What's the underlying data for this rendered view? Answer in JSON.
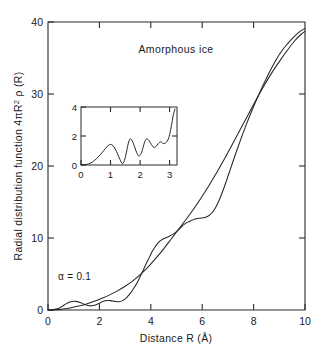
{
  "figure": {
    "title": "Amorphous ice",
    "annotation": "α = 0.1",
    "xlabel": "Distance  R (Å)",
    "ylabel_prefix": "Radial  distribution  function  4πR",
    "ylabel_exp": "2",
    "ylabel_suffix": " ρ (R)",
    "xticks": [
      "0",
      "2",
      "4",
      "6",
      "8",
      "10"
    ],
    "yticks": [
      "0",
      "10",
      "20",
      "30",
      "40"
    ],
    "inset_xticks": [
      "0",
      "1",
      "2",
      "3"
    ],
    "inset_yticks": [
      "0",
      "2",
      "4"
    ]
  },
  "chart_data": {
    "type": "line",
    "title": "Amorphous ice",
    "xlabel": "Distance  R (Å)",
    "ylabel": "Radial distribution function 4πR² ρ(R)",
    "xlim": [
      0,
      10
    ],
    "ylim": [
      0,
      40
    ],
    "xticks": [
      0,
      2,
      4,
      6,
      8,
      10
    ],
    "yticks": [
      0,
      10,
      20,
      30,
      40
    ],
    "grid": false,
    "legend": "none",
    "annotations": [
      {
        "text": "α = 0.1",
        "x": 0.55,
        "y": 4.6
      },
      {
        "text": "Amorphous ice",
        "x": 5.0,
        "y": 37.0
      }
    ],
    "series": [
      {
        "name": "experimental RDF (oscillatory)",
        "x": [
          0.0,
          0.2,
          0.4,
          0.55,
          0.7,
          0.85,
          1.0,
          1.1,
          1.25,
          1.4,
          1.55,
          1.7,
          1.85,
          2.0,
          2.15,
          2.3,
          2.45,
          2.6,
          2.75,
          2.9,
          3.05,
          3.2,
          3.35,
          3.5,
          3.7,
          3.9,
          4.1,
          4.3,
          4.5,
          4.7,
          4.9,
          5.1,
          5.3,
          5.5,
          5.7,
          5.9,
          6.1,
          6.3,
          6.5,
          6.7,
          6.9,
          7.1,
          7.3,
          7.5,
          7.7,
          7.9,
          8.1,
          8.3,
          8.5,
          8.7,
          8.9,
          9.1,
          9.3,
          9.5,
          9.7,
          9.85,
          10.0
        ],
        "y": [
          0.0,
          0.05,
          0.2,
          0.5,
          0.85,
          1.1,
          1.22,
          1.2,
          1.05,
          0.8,
          0.62,
          0.58,
          0.7,
          0.95,
          1.2,
          1.32,
          1.3,
          1.2,
          1.15,
          1.3,
          1.7,
          2.3,
          3.1,
          4.0,
          5.5,
          7.0,
          8.4,
          9.4,
          9.9,
          10.2,
          10.6,
          11.2,
          11.9,
          12.3,
          12.6,
          12.75,
          12.85,
          13.2,
          14.1,
          15.6,
          17.5,
          19.6,
          21.7,
          23.7,
          25.6,
          27.4,
          29.1,
          30.7,
          32.2,
          33.6,
          34.9,
          36.0,
          36.9,
          37.7,
          38.4,
          38.8,
          39.1
        ]
      },
      {
        "name": "smooth 4πR²ρ₀ reference",
        "x": [
          0.0,
          0.3,
          0.6,
          0.9,
          1.2,
          1.5,
          1.8,
          2.1,
          2.4,
          2.7,
          3.0,
          3.3,
          3.6,
          3.9,
          4.2,
          4.5,
          4.8,
          5.1,
          5.4,
          5.7,
          6.0,
          6.3,
          6.6,
          6.9,
          7.2,
          7.5,
          7.8,
          8.1,
          8.4,
          8.7,
          9.0,
          9.3,
          9.6,
          9.85,
          10.0
        ],
        "y": [
          0.0,
          0.05,
          0.15,
          0.32,
          0.55,
          0.85,
          1.2,
          1.62,
          2.1,
          2.66,
          3.3,
          4.05,
          4.95,
          6.0,
          7.2,
          8.5,
          9.9,
          11.3,
          12.7,
          14.2,
          15.8,
          17.5,
          19.3,
          21.2,
          23.2,
          25.2,
          27.2,
          29.2,
          31.1,
          32.9,
          34.5,
          36.0,
          37.4,
          38.3,
          38.7
        ]
      }
    ],
    "inset": {
      "type": "line",
      "xlim": [
        0,
        3.25
      ],
      "ylim": [
        0,
        4
      ],
      "xticks": [
        0,
        1,
        2,
        3
      ],
      "yticks": [
        0,
        2,
        4
      ],
      "grid": false,
      "series": [
        {
          "name": "short-range RDF detail",
          "x": [
            0.0,
            0.18,
            0.32,
            0.45,
            0.58,
            0.7,
            0.82,
            0.92,
            1.0,
            1.08,
            1.16,
            1.24,
            1.32,
            1.4,
            1.47,
            1.54,
            1.6,
            1.66,
            1.72,
            1.8,
            1.88,
            1.96,
            2.04,
            2.1,
            2.16,
            2.22,
            2.3,
            2.38,
            2.46,
            2.54,
            2.62,
            2.7,
            2.78,
            2.86,
            2.94,
            3.0,
            3.06,
            3.12,
            3.18
          ],
          "y": [
            0.02,
            0.04,
            0.12,
            0.3,
            0.55,
            0.82,
            1.12,
            1.35,
            1.42,
            1.34,
            1.1,
            0.76,
            0.38,
            0.1,
            0.3,
            0.9,
            1.48,
            1.8,
            1.72,
            1.34,
            0.88,
            0.62,
            0.8,
            1.2,
            1.62,
            1.8,
            1.7,
            1.42,
            1.22,
            1.28,
            1.48,
            1.6,
            1.48,
            1.52,
            1.72,
            2.1,
            2.7,
            3.4,
            3.85
          ]
        }
      ]
    }
  }
}
